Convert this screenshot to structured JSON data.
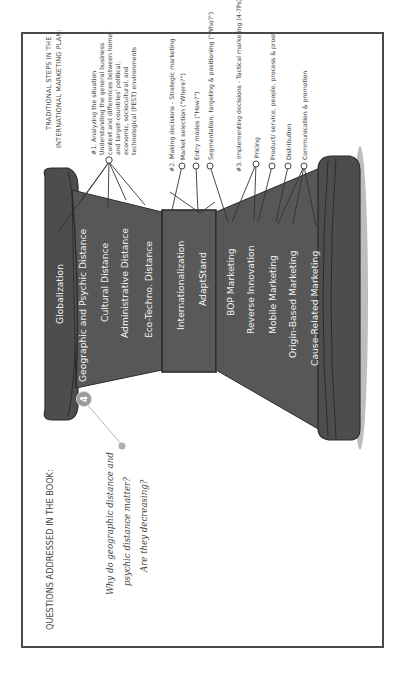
{
  "header": {
    "line1": "TRADITIONAL STEPS IN THE",
    "line2": "INTERNATIONAL MARKETING PLAN:"
  },
  "steps": {
    "step1": {
      "title": "#1. Analyzing the situation",
      "lines": [
        "Understanding the general business",
        "context and differences between home-",
        "and target-countries' political,",
        "economic, sociocultural, and",
        "technological (PEST) environments"
      ]
    },
    "step2": {
      "title": "#2. Making decisions - Strategic marketing",
      "items": [
        "Market selection (\"Where?\")",
        "Entry modes (\"How?\")",
        "Segmentation, targeting & positioning (\"Who?\")"
      ]
    },
    "step3": {
      "title": "#3. Implementing decisions - Tactical marketing (4-7Ps)",
      "items": [
        "Pricing",
        "Product/ service, people, process & proof",
        "Distribution",
        "Communication & promotion"
      ]
    }
  },
  "hourglass": {
    "top_cap": "Globalization",
    "upper_section": [
      "Geographic and Psychic Distance",
      "Cultural Distance",
      "Administrative Distance",
      "Eco-Techno. Distance"
    ],
    "waist": [
      "Internationalization",
      "AdaptStand"
    ],
    "lower_section": [
      "BOP Marketing",
      "Reverse Innovation",
      "Mobile Marketing",
      "Origin-Based Marketing",
      "Cause-Related Marketing"
    ],
    "chapter_badge": "4",
    "colors": {
      "body": "#555555",
      "cap": "#4d4d4d",
      "outline": "#2b2b2b",
      "badge": "#9a9a9a",
      "shadow": "#b8b8b8"
    }
  },
  "questions": {
    "heading": "QUESTIONS ADDRESSED IN THE BOOK:",
    "lines": [
      "Why do geographic distance and",
      "psychic distance matter?",
      "Are they decreasing?"
    ]
  }
}
